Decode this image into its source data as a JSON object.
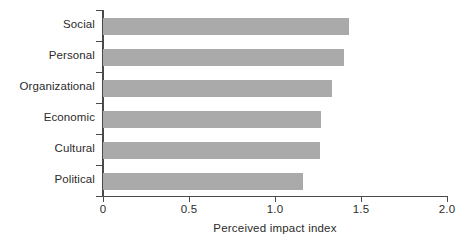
{
  "chart_data": {
    "type": "bar",
    "orientation": "horizontal",
    "title": "",
    "subtitle": "",
    "xlabel": "Perceived impact index",
    "ylabel": "",
    "categories": [
      "Social",
      "Personal",
      "Organizational",
      "Economic",
      "Cultural",
      "Political"
    ],
    "values": [
      1.43,
      1.4,
      1.33,
      1.27,
      1.26,
      1.16
    ],
    "series": [
      {
        "name": "Perceived impact index",
        "values": [
          1.43,
          1.4,
          1.33,
          1.27,
          1.26,
          1.16
        ]
      }
    ],
    "xlim": [
      0,
      2.0
    ],
    "xticks": [
      0,
      0.5,
      1.0,
      1.5,
      2.0
    ],
    "xtick_labels": [
      "0",
      "0.5",
      "1.0",
      "1.5",
      "2.0"
    ],
    "grid": false,
    "legend": false,
    "legend_position": "none",
    "bar_color": "#aaaaaa",
    "axis_color": "#4a4a4a",
    "text_color": "#2b2b2b",
    "background": "#ffffff"
  }
}
